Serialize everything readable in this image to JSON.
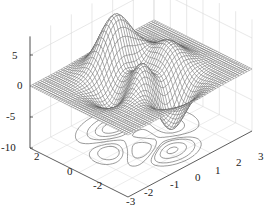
{
  "chart_data": {
    "type": "surface",
    "subtype": "mesh with contour (surfc)",
    "function": "peaks",
    "title": "",
    "xlabel": "",
    "ylabel": "",
    "zlabel": "",
    "x_ticks": [
      "-3",
      "-2",
      "-1",
      "0",
      "1",
      "2",
      "3"
    ],
    "y_ticks": [
      "2",
      "0",
      "-2"
    ],
    "z_ticks": [
      "5",
      "0",
      "-5",
      "-10"
    ],
    "xlim": [
      -3,
      3
    ],
    "ylim": [
      -3,
      3
    ],
    "zlim": [
      -10,
      8
    ],
    "grid": true,
    "grid_resolution": 49,
    "contour_levels": [
      -6,
      -4,
      -2,
      -1,
      0.5,
      2,
      4,
      6
    ],
    "colors": {
      "mesh_line": "#555555",
      "face": "#ffffff",
      "contour": "#555555",
      "axis": "#333333",
      "grid": "#d8d8d8"
    }
  }
}
